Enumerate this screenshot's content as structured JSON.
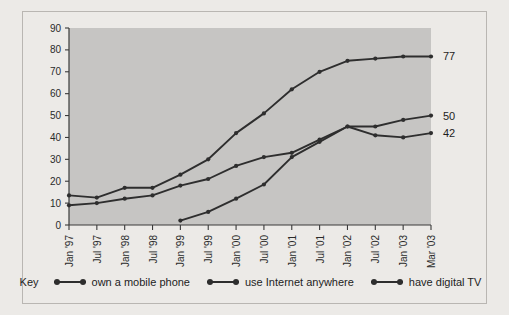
{
  "legend": {
    "key_label": "Key",
    "items": [
      {
        "label": "own a mobile phone"
      },
      {
        "label": "use Internet anywhere"
      },
      {
        "label": "have digital TV"
      }
    ]
  },
  "end_labels": [
    {
      "text": "77",
      "series": "own a mobile phone"
    },
    {
      "text": "50",
      "series": "use Internet anywhere"
    },
    {
      "text": "42",
      "series": "have digital TV"
    }
  ],
  "colors": {
    "page_background": "#eceae7",
    "plot_background": "#c6c5c3",
    "line": "#2e2e2e",
    "axis": "#3a3a3a",
    "frame_border": "#b9b6b2"
  },
  "chart_data": {
    "type": "line",
    "title": "",
    "subtitle": "",
    "xlabel": "",
    "ylabel": "",
    "ylim": [
      0,
      90
    ],
    "yticks": [
      0,
      10,
      20,
      30,
      40,
      50,
      60,
      70,
      80,
      90
    ],
    "grid": false,
    "legend_position": "bottom",
    "categories": [
      "Jan '97",
      "Jul '97",
      "Jan '98",
      "Jul '98",
      "Jan '99",
      "Jul '99",
      "Jan '00",
      "Jul '00",
      "Jan '01",
      "Jul '01",
      "Jan '02",
      "Jul '02",
      "Jan '03",
      "Mar '03"
    ],
    "series": [
      {
        "name": "own a mobile phone",
        "end_label": "77",
        "values": [
          13.5,
          12.5,
          17,
          17,
          23,
          30,
          42,
          51,
          62,
          70,
          75,
          76,
          77,
          77
        ]
      },
      {
        "name": "use Internet anywhere",
        "end_label": "50",
        "values": [
          null,
          null,
          null,
          null,
          2,
          6,
          12,
          18.5,
          31,
          38,
          45,
          45,
          48,
          50
        ]
      },
      {
        "name": "have digital TV",
        "end_label": "42",
        "values": [
          9,
          10,
          12,
          13.5,
          18,
          21,
          27,
          31,
          33,
          39,
          45,
          41,
          40,
          42
        ]
      }
    ]
  }
}
